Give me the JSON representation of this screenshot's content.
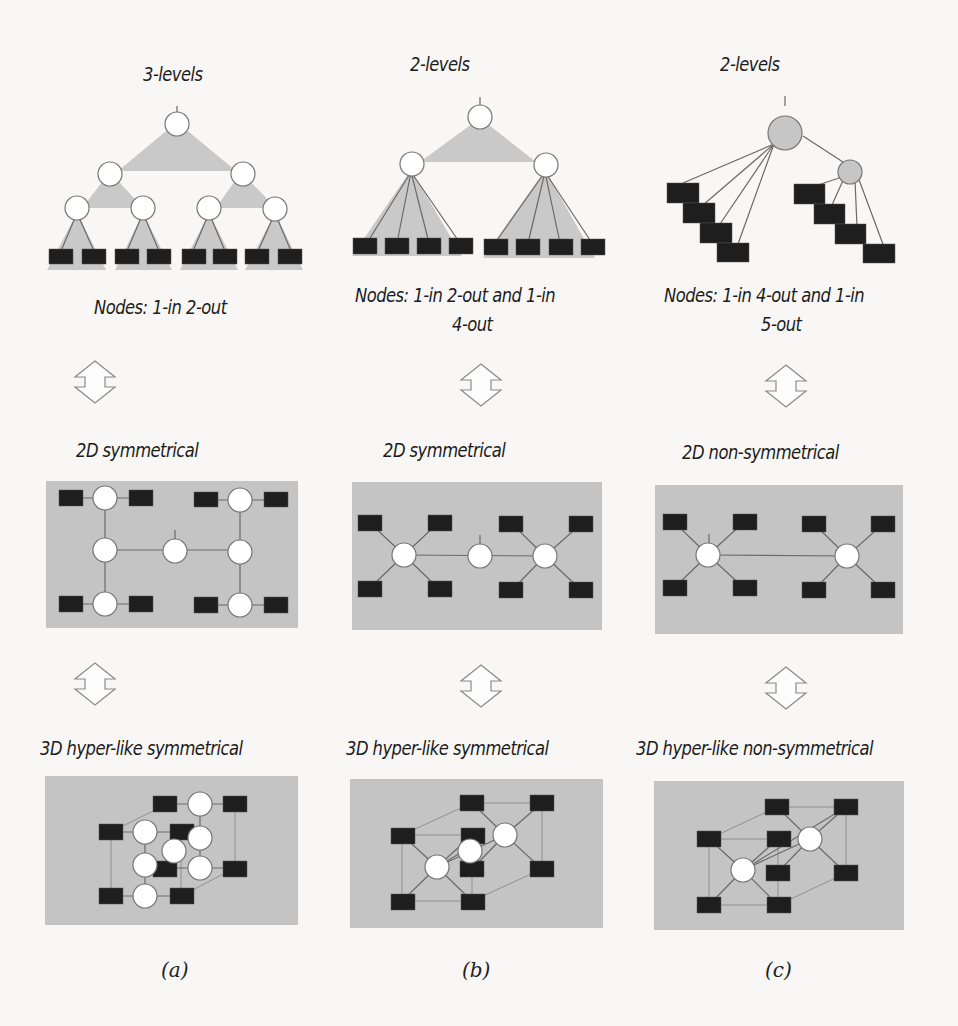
{
  "figure": {
    "columns": [
      {
        "id": "a",
        "caption": "(a)",
        "top_title": "3-levels",
        "node_desc": "Nodes: 1-in 2-out",
        "mid_title": "2D symmetrical",
        "bottom_title": "3D hyper-like symmetrical"
      },
      {
        "id": "b",
        "caption": "(b)",
        "top_title": "2-levels",
        "node_desc_line1": "Nodes: 1-in 2-out and 1-in",
        "node_desc_line2": "4-out",
        "mid_title": "2D symmetrical",
        "bottom_title": "3D hyper-like symmetrical"
      },
      {
        "id": "c",
        "caption": "(c)",
        "top_title": "2-levels",
        "node_desc_line1": "Nodes: 1-in 4-out and 1-in",
        "node_desc_line2": "5-out",
        "mid_title": "2D non-symmetrical",
        "bottom_title": "3D hyper-like non-symmetrical"
      }
    ],
    "colors": {
      "panel_grey": "#c4c4c4",
      "triangle_grey": "#c9c9c9",
      "leaf_black": "#1e1e1e",
      "node_white": "#ffffff",
      "node_grey": "#c6c6c6",
      "edge": "#6a6a6a"
    }
  }
}
